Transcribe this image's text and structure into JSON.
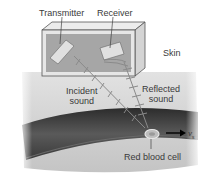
{
  "labels": {
    "transmitter": "Transmitter",
    "receiver": "Receiver",
    "skin": "Skin",
    "incident_line1": "Incident",
    "incident_line2": "sound",
    "reflected_line1": "Reflected",
    "reflected_line2": "sound",
    "red_blood_cell": "Red blood cell",
    "velocity_symbol": "v",
    "velocity_subscript": "s"
  },
  "colors": {
    "background": "#ffffff",
    "skin": "#cfcfcf",
    "vessel": "#4a4a4a",
    "box_frame": "#d8d8d8",
    "box_inner": "#a8a8a8",
    "wave": "#8a8a8a",
    "text": "#3a3a3a"
  }
}
